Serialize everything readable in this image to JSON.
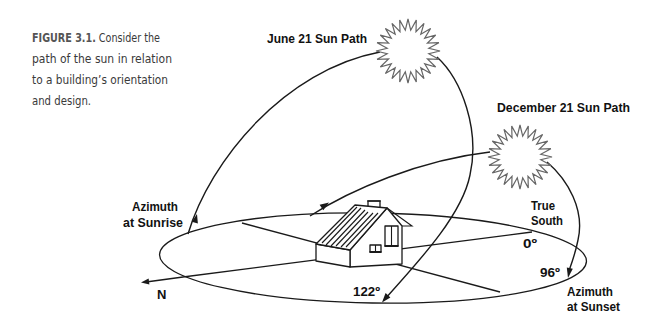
{
  "figure": {
    "caption": {
      "label": "FIGURE 3.1.",
      "line1_rest": " Consider the",
      "line2": "path of the sun in relation",
      "line3": "to a building’s orientation",
      "line4": "and design."
    },
    "sun_paths": {
      "june": "June 21 Sun Path",
      "december": "December 21 Sun Path"
    },
    "azimuth_sunrise": {
      "line1": "Azimuth",
      "line2": "at Sunrise"
    },
    "azimuth_sunset": {
      "line1": "Azimuth",
      "line2": "at Sunset"
    },
    "true_south": {
      "line1": "True",
      "line2": "South"
    },
    "angles": {
      "south": "0º",
      "december_sunset": "96º",
      "june_sunset": "122º"
    },
    "north": "N",
    "icons": {
      "june_sun": "sun-icon",
      "december_sun": "sun-icon",
      "house": "house-icon"
    },
    "colors": {
      "line": "#1a1a1a",
      "sun_stroke": "#666666",
      "caption_text": "#3a3a3a",
      "caption_label": "#555555"
    }
  }
}
